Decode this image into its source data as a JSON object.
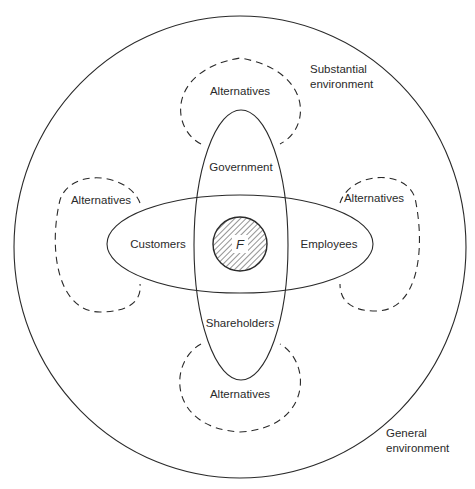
{
  "diagram": {
    "type": "nested-environment-stakeholder-diagram",
    "zones": {
      "general_environment": "General\nenvironment",
      "general_environment_lines": [
        "General",
        "environment"
      ],
      "substantial_environment_lines": [
        "Substantial",
        "environment"
      ]
    },
    "stakeholders": {
      "top": "Government",
      "left": "Customers",
      "right": "Employees",
      "bottom": "Shareholders"
    },
    "firm": {
      "label": "F",
      "fill_pattern": "diagonal-hatch"
    },
    "alternatives": {
      "top": "Alternatives",
      "left": "Alternatives",
      "right": "Alternatives",
      "bottom": "Alternatives"
    },
    "colors": {
      "stroke": "#2a2a2a",
      "background": "#ffffff",
      "text": "#2a2a2a"
    }
  }
}
